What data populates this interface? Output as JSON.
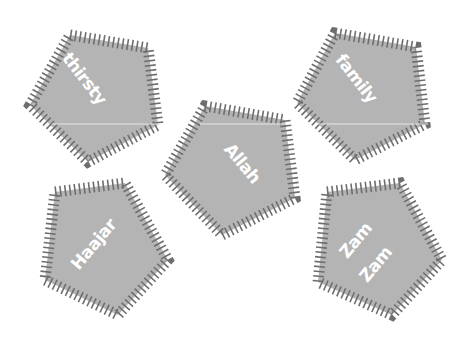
{
  "colors": {
    "background": "#ffffff",
    "pentagon_fill": "#b4b4b4",
    "hatch_stroke": "#6e6e6e",
    "label_text": "#ffffff"
  },
  "pentagons": [
    {
      "id": "thirsty",
      "lines": [
        "thirsty"
      ]
    },
    {
      "id": "family",
      "lines": [
        "family"
      ]
    },
    {
      "id": "allah",
      "lines": [
        "Allah"
      ]
    },
    {
      "id": "haajar",
      "lines": [
        "Haajar"
      ]
    },
    {
      "id": "zamzam",
      "lines": [
        "Zam",
        "Zam"
      ]
    }
  ]
}
